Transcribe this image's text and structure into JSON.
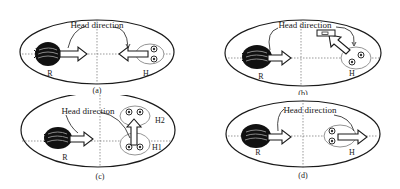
{
  "figure": {
    "panels": [
      {
        "id": "a",
        "caption": "(a)",
        "annotation": "Head direction",
        "robot_label": "R",
        "human_labels": [
          "H"
        ]
      },
      {
        "id": "b",
        "caption": "(b)",
        "annotation": "Head direction",
        "robot_label": "R",
        "human_labels": [
          "H"
        ]
      },
      {
        "id": "c",
        "caption": "(c)",
        "annotation": "Head direction",
        "robot_label": "R",
        "human_labels": [
          "H2",
          "H1"
        ]
      },
      {
        "id": "d",
        "caption": "(d)",
        "annotation": "Head direction",
        "robot_label": "R",
        "human_labels": [
          "H"
        ]
      }
    ],
    "colors": {
      "stroke": "#1a1a1a",
      "background": "#ffffff",
      "axis": "#555555",
      "robot_dark": "#111111",
      "head_ring": "#888888"
    }
  }
}
